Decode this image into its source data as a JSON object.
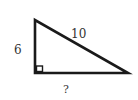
{
  "diagram": {
    "type": "right-triangle",
    "labels": {
      "vertical_leg": "6",
      "hypotenuse": "10",
      "horizontal_leg": "?"
    },
    "right_angle_marker": true,
    "colors": {
      "stroke": "#1a1a1a",
      "text": "#333333",
      "background": "#ffffff"
    }
  }
}
